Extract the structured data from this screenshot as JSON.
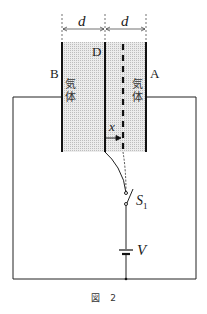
{
  "figure": {
    "caption_prefix": "図",
    "caption_number": "2"
  },
  "labels": {
    "plate_b": "B",
    "plate_d": "D",
    "plate_a": "A",
    "gap_left": "d",
    "gap_right": "d",
    "displacement": "x",
    "switch": "S",
    "switch_sub": "1",
    "battery": "V"
  },
  "gas_labels": {
    "left_line1": "気",
    "left_line2": "体",
    "right_line1": "気",
    "right_line2": "体"
  },
  "colors": {
    "line": "#111111",
    "gas_fill": "#d9d9d9",
    "background": "#ffffff"
  }
}
